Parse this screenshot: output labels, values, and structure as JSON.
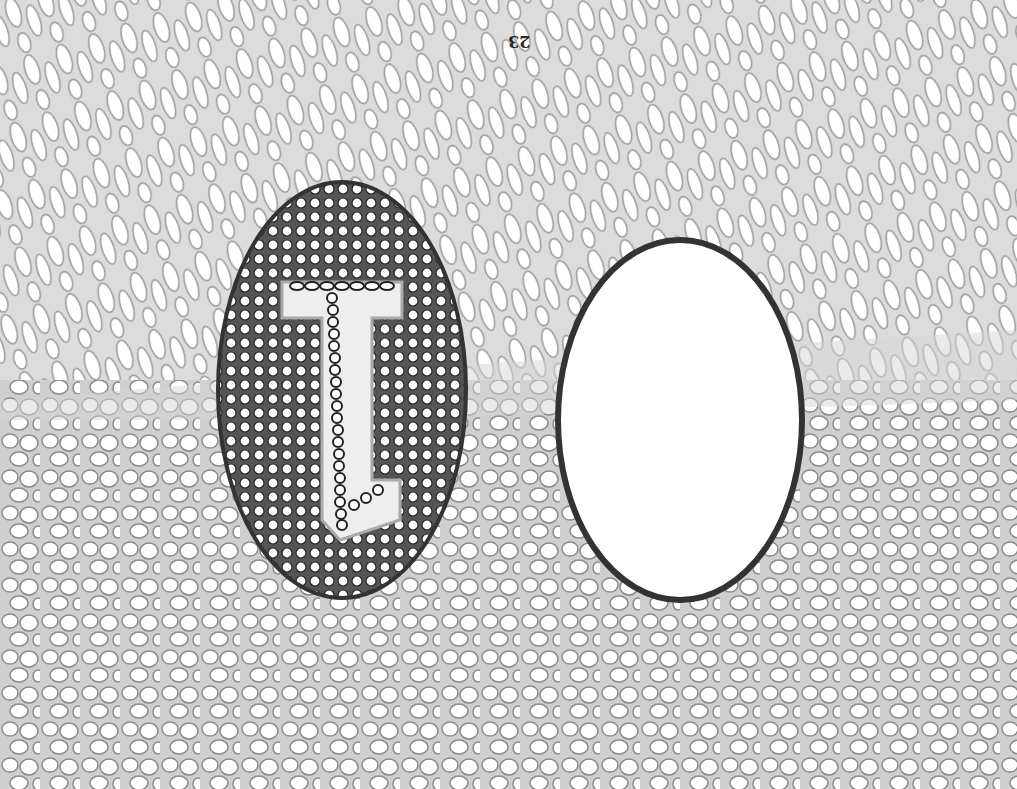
{
  "illustration": {
    "title": "Pen drawing of cellular tissue with two ovals",
    "page_number": "23",
    "page_number_orientation": "upside-down",
    "left_oval": {
      "content": "cell-filled oval with a letter-like 'I/L' chain of cells"
    },
    "right_oval": {
      "content": "empty white oval with thick dark outline"
    },
    "colors": {
      "background": "#f4f4f4",
      "cell_stroke": "#8a8a8a",
      "dark_outline": "#333333",
      "oval_fill": "#ffffff"
    }
  }
}
